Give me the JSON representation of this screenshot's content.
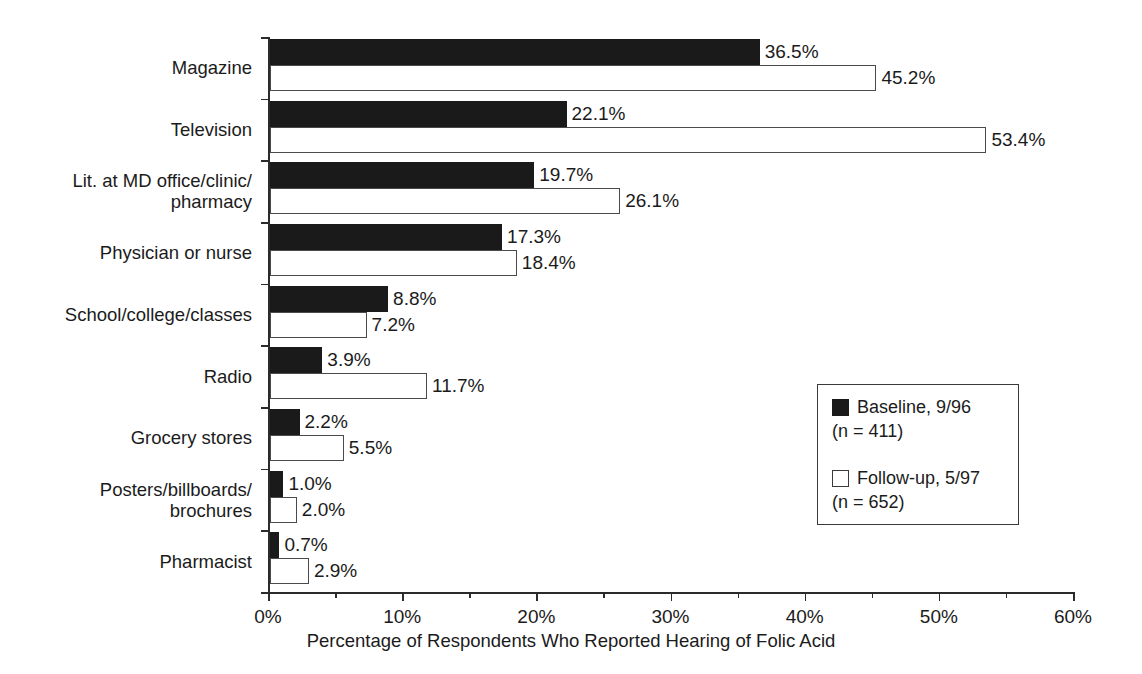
{
  "chart_data": {
    "type": "bar",
    "orientation": "horizontal",
    "title": "",
    "xlabel": "Percentage of Respondents Who Reported Hearing of Folic Acid",
    "ylabel": "",
    "xlim": [
      0,
      60
    ],
    "xtick_labels": [
      "0%",
      "10%",
      "20%",
      "30%",
      "40%",
      "50%",
      "60%"
    ],
    "xtick_values": [
      0,
      10,
      20,
      30,
      40,
      50,
      60
    ],
    "xtick_minor_values": [
      5,
      15,
      25,
      35,
      45,
      55
    ],
    "grid": false,
    "legend_position": "center-right",
    "categories": [
      "Magazine",
      "Television",
      "Lit. at MD office/clinic/\npharmacy",
      "Physician or nurse",
      "School/college/classes",
      "Radio",
      "Grocery stores",
      "Posters/billboards/\nbrochures",
      "Pharmacist"
    ],
    "series": [
      {
        "name": "Baseline, 9/96",
        "n": 411,
        "legend_label": "Baseline, 9/96",
        "legend_sub": "(n = 411)",
        "color": "#1a1a1a",
        "style": "filled",
        "values": [
          36.5,
          22.1,
          19.7,
          17.3,
          8.8,
          3.9,
          2.2,
          1.0,
          0.7
        ],
        "value_labels": [
          "36.5%",
          "22.1%",
          "19.7%",
          "17.3%",
          "8.8%",
          "3.9%",
          "2.2%",
          "1.0%",
          "0.7%"
        ]
      },
      {
        "name": "Follow-up, 5/97",
        "n": 652,
        "legend_label": "Follow-up, 5/97",
        "legend_sub": "(n = 652)",
        "color": "#ffffff",
        "style": "hollow",
        "values": [
          45.2,
          53.4,
          26.1,
          18.4,
          7.2,
          11.7,
          5.5,
          2.0,
          2.9
        ],
        "value_labels": [
          "45.2%",
          "53.4%",
          "26.1%",
          "18.4%",
          "7.2%",
          "11.7%",
          "5.5%",
          "2.0%",
          "2.9%"
        ]
      }
    ]
  }
}
